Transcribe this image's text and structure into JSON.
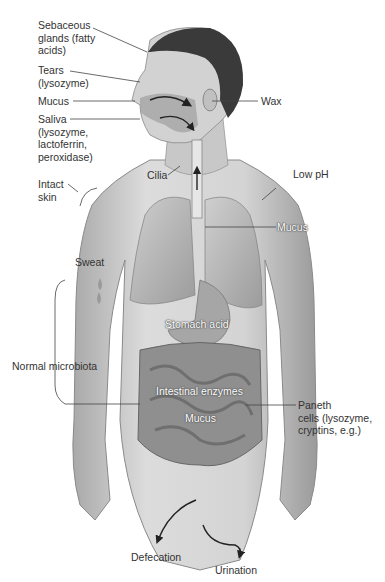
{
  "figure": {
    "labels": {
      "sebaceous": "Sebaceous\nglands (fatty\nacids)",
      "tears": "Tears\n(lysozyme)",
      "mucus_nose": "Mucus",
      "saliva": "Saliva\n(lysozyme,\nlactoferrin,\nperoxidase)",
      "intact_skin": "Intact\nskin",
      "cilia": "Cilia",
      "wax": "Wax",
      "low_ph": "Low pH",
      "mucus_lung": "Mucus",
      "sweat": "Sweat",
      "stomach_acid": "Stomach acid",
      "normal_microbiota": "Normal microbiota",
      "intestinal_enzymes": "Intestinal enzymes",
      "mucus_gut": "Mucus",
      "paneth": "Paneth\ncells (lysozyme,\ncryptins, e.g.)",
      "defecation": "Defecation",
      "urination": "Urination"
    },
    "colors": {
      "background": "#ffffff",
      "label_text": "#333333",
      "leader_line": "#444444",
      "skin_light": "#d9d9d9",
      "skin_shade": "#a8a8a8",
      "hair": "#3a3a3a",
      "organ": "#b5b5b5"
    }
  }
}
